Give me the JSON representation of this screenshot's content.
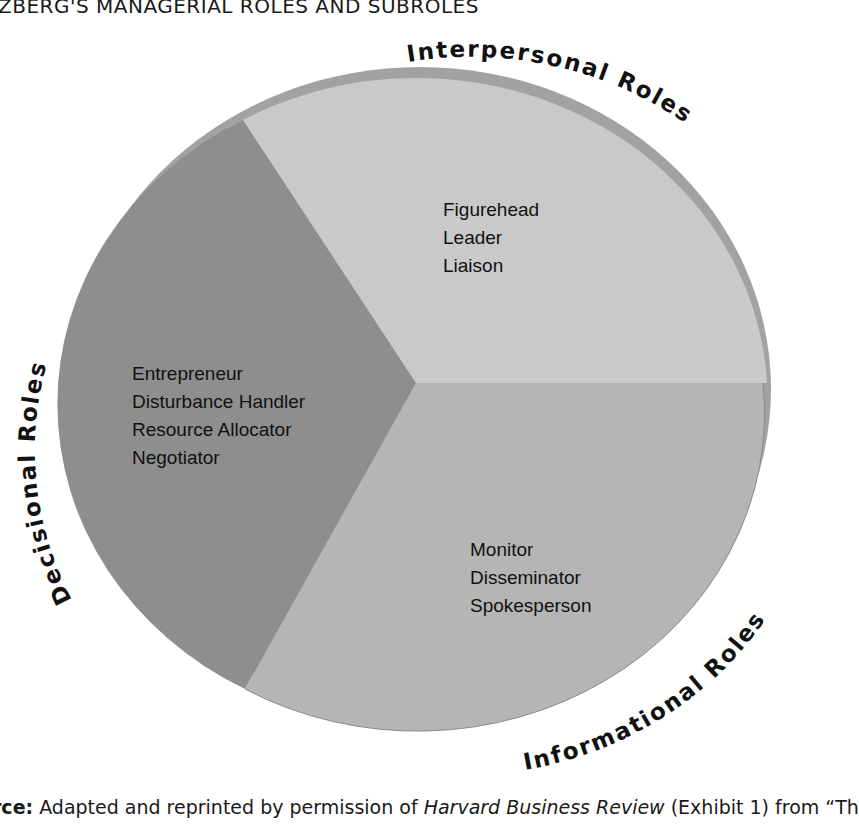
{
  "title": "ZBERG'S MANAGERIAL ROLES AND SUBROLES",
  "caption": {
    "prefix": "rce:",
    "text1": " Adapted and reprinted by permission of ",
    "journal": "Harvard Business Review",
    "text2": " (Exhibit 1) from “Th"
  },
  "diagram": {
    "type": "pie",
    "segments": [
      {
        "name": "Interpersonal Roles",
        "color": "#c9c9c9",
        "subroles": [
          "Figurehead",
          "Leader",
          "Liaison"
        ]
      },
      {
        "name": "Informational Roles",
        "color": "#b5b5b5",
        "subroles": [
          "Monitor",
          "Disseminator",
          "Spokesperson"
        ]
      },
      {
        "name": "Decisional Roles",
        "color": "#8e8e8e",
        "subroles": [
          "Entrepreneur",
          "Disturbance Handler",
          "Resource Allocator",
          "Negotiator"
        ]
      }
    ],
    "rim_color": "#9e9e9e"
  }
}
